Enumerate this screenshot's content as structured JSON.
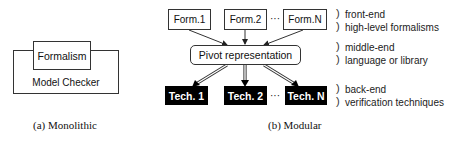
{
  "monolithic": {
    "outer_label": "Model Checker",
    "inner_label": "Formalism",
    "caption": "(a) Monolithic"
  },
  "modular": {
    "formalisms": [
      "Form.1",
      "Form.2",
      "Form.N"
    ],
    "ellipsis": "···",
    "pivot": "Pivot representation",
    "techniques": [
      "Tech. 1",
      "Tech. 2",
      "Tech. N"
    ],
    "caption": "(b) Modular"
  },
  "layers": [
    {
      "title": "front-end",
      "desc": "high-level formalisms"
    },
    {
      "title": "middle-end",
      "desc": "language or library"
    },
    {
      "title": "back-end",
      "desc": "verification techniques"
    }
  ],
  "brace_glyphs": {
    "top": ")",
    "bottom": ")"
  }
}
